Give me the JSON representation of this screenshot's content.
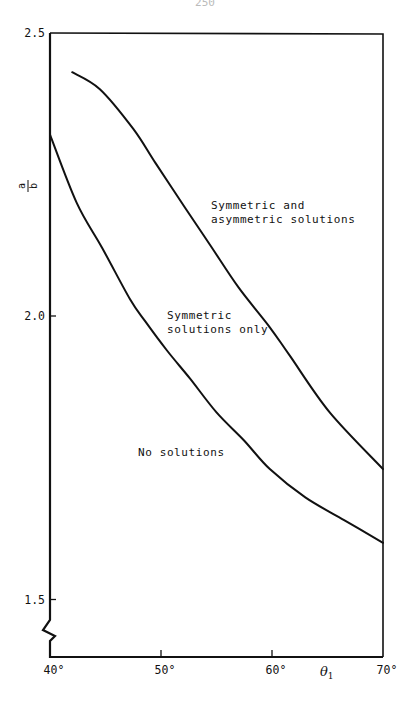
{
  "page": {
    "number_fragment": "250"
  },
  "chart_data": {
    "type": "line",
    "title": "",
    "xlabel": "θ1",
    "xlabel_main": "θ",
    "xlabel_sub": "1",
    "ylabel": "a/b",
    "ylabel_num": "a",
    "ylabel_den": "b",
    "xlim": [
      40,
      70
    ],
    "ylim": [
      1.4,
      2.5
    ],
    "y_axis_break": true,
    "grid": false,
    "legend": "none (regions labelled inline)",
    "x_ticks": [
      {
        "value": 40,
        "label": "40°"
      },
      {
        "value": 50,
        "label": "50°"
      },
      {
        "value": 60,
        "label": "60°"
      },
      {
        "value": 70,
        "label": "70°"
      }
    ],
    "y_ticks": [
      {
        "value": 2.5,
        "label": "2.5"
      },
      {
        "value": 2.0,
        "label": "2.0"
      },
      {
        "value": 1.5,
        "label": "1.5"
      }
    ],
    "series": [
      {
        "name": "Upper boundary (asymmetric solutions onset)",
        "x": [
          42.0,
          44.5,
          47.5,
          49.5,
          52.2,
          54.6,
          57.0,
          59.8,
          61.6,
          65.2,
          70.0
        ],
        "y": [
          2.43,
          2.4,
          2.33,
          2.27,
          2.19,
          2.12,
          2.05,
          1.98,
          1.93,
          1.83,
          1.73
        ]
      },
      {
        "name": "Lower boundary (symmetric solutions onset)",
        "x": [
          40.0,
          42.4,
          44.7,
          47.2,
          48.6,
          50.5,
          52.6,
          55.0,
          57.5,
          59.8,
          63.0,
          66.5,
          70.0
        ],
        "y": [
          2.32,
          2.2,
          2.12,
          2.03,
          1.99,
          1.94,
          1.89,
          1.83,
          1.78,
          1.73,
          1.68,
          1.64,
          1.6
        ]
      }
    ],
    "annotations": [
      {
        "id": "both",
        "text_lines": [
          "Symmetric and",
          "asymmetric solutions"
        ],
        "x": 54.0,
        "y": 2.15
      },
      {
        "id": "sym",
        "text_lines": [
          "Symmetric",
          "solutions only"
        ],
        "x": 50.5,
        "y": 2.01
      },
      {
        "id": "none",
        "text_lines": [
          "No solutions"
        ],
        "x": 48.0,
        "y": 1.77
      }
    ]
  },
  "layout": {
    "plot_left_px": 50,
    "plot_right_px": 383,
    "plot_top_px": 33,
    "plot_bottom_px": 657,
    "x_min": 40,
    "x_max": 70,
    "y_ref_value": 2.0,
    "y_ref_px": 316,
    "px_per_unit_y": 567,
    "line_color": "#111111"
  }
}
